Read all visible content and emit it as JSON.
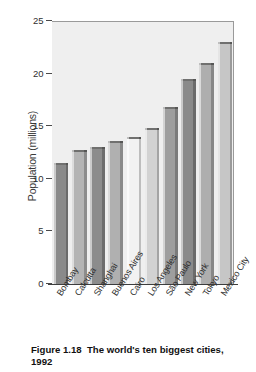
{
  "chart_data": {
    "type": "bar",
    "title": "",
    "xlabel": "",
    "ylabel": "Population (millions)",
    "ylim": [
      0,
      25
    ],
    "yticks": [
      0,
      5,
      10,
      15,
      20,
      25
    ],
    "grid": false,
    "legend_position": "none",
    "categories": [
      "Bombay",
      "Calcutta",
      "Shanghai",
      "Buenos Aires",
      "Cairo",
      "Los Angeles",
      "São Paulo",
      "New York",
      "Tokyo",
      "Mexico City"
    ],
    "values": [
      11.5,
      12.7,
      13.0,
      13.6,
      14.0,
      14.8,
      16.8,
      19.5,
      21.0,
      23.0
    ],
    "bar_colors": [
      "#8a8a8a",
      "#b4b4b4",
      "#8c8c8c",
      "#b0b0b0",
      "#f2f2f2",
      "#d2d2d2",
      "#9e9e9e",
      "#8a8a8a",
      "#aeaeae",
      "#c6c6c6"
    ],
    "units": "millions"
  },
  "axis": {
    "y_title": "Population (millions)",
    "tick_labels": [
      "25",
      "20",
      "15",
      "10",
      "5",
      "0"
    ]
  },
  "caption": {
    "text": "Figure 1.18  The world's ten biggest cities, 1992",
    "figure_number": "Figure 1.18",
    "description": "The world's ten biggest cities, 1992"
  },
  "colors": {
    "plot_background": "#efefef",
    "axis_line": "#3d3d3d",
    "text": "#2f2f2f"
  }
}
